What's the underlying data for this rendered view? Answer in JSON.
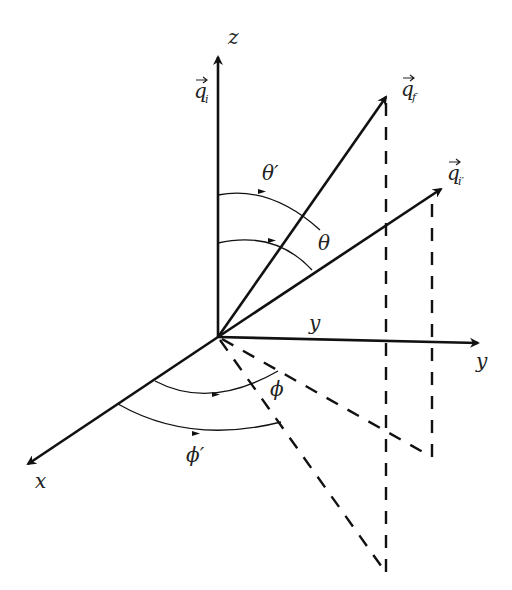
{
  "diagram": {
    "axes": {
      "z_label": "z",
      "y_label": "y",
      "y_inner_label": "y",
      "x_label": "x"
    },
    "vectors": {
      "q_i": {
        "symbol": "q",
        "subscript": "i"
      },
      "q_f": {
        "symbol": "q",
        "subscript": "f"
      },
      "q_i_prime": {
        "symbol": "q",
        "subscript": "i′"
      }
    },
    "angles": {
      "theta_prime": "θ′",
      "theta": "θ",
      "phi": "ϕ",
      "phi_prime": "ϕ′"
    },
    "colors": {
      "line": "#111111",
      "text": "#222222",
      "background": "#ffffff"
    }
  }
}
